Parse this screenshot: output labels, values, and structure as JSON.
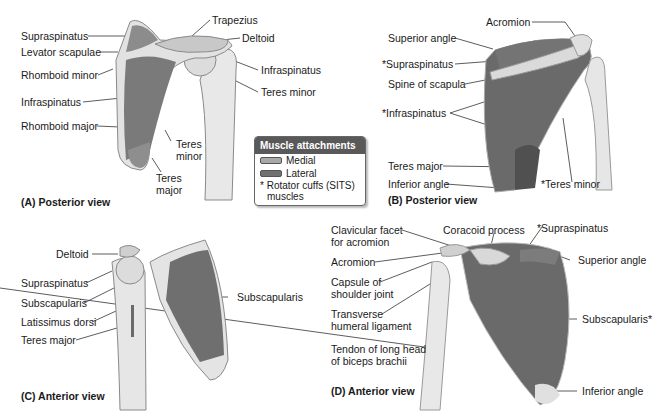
{
  "panels": {
    "A": {
      "caption": "(A) Posterior view",
      "labels": {
        "supraspinatus": "Supraspinatus",
        "levator_scapulae": "Levator scapulae",
        "rhomboid_minor": "Rhomboid minor",
        "infraspinatus": "Infraspinatus",
        "rhomboid_major": "Rhomboid major",
        "trapezius": "Trapezius",
        "deltoid": "Deltoid",
        "infraspinatus_humerus": "Infraspinatus",
        "teres_minor_humerus": "Teres minor",
        "teres_minor_1": "Teres",
        "teres_minor_2": "minor",
        "teres_major_1": "Teres",
        "teres_major_2": "major"
      }
    },
    "B": {
      "caption": "(B) Posterior view",
      "labels": {
        "acromion": "Acromion",
        "superior_angle": "Superior angle",
        "supraspinatus": "*Supraspinatus",
        "spine_of_scapula": "Spine of scapula",
        "infraspinatus": "*Infraspinatus",
        "teres_major": "Teres major",
        "inferior_angle": "Inferior angle",
        "teres_minor": "*Teres minor"
      }
    },
    "C": {
      "caption": "(C) Anterior view",
      "labels": {
        "deltoid": "Deltoid",
        "supraspinatus": "Supraspinatus",
        "subscapularis": "Subscapularis",
        "latissimus_dorsi": "Latissimus dorsi",
        "teres_major": "Teres major",
        "subscapularis_right": "Subscapularis"
      }
    },
    "D": {
      "caption": "(D) Anterior view",
      "labels": {
        "clavicular_facet_1": "Clavicular facet",
        "clavicular_facet_2": "for acromion",
        "coracoid_process": "Coracoid process",
        "supraspinatus": "*Supraspinatus",
        "acromion": "Acromion",
        "superior_angle": "Superior angle",
        "capsule_1": "Capsule of",
        "capsule_2": "shoulder joint",
        "transverse_1": "Transverse",
        "transverse_2": "humeral ligament",
        "subscapularis": "Subscapularis*",
        "tendon_1": "Tendon of long head",
        "tendon_2": "of biceps brachii",
        "inferior_angle": "Inferior angle"
      }
    }
  },
  "legend": {
    "title": "Muscle attachments",
    "items": [
      {
        "label": "Medial",
        "color": "#a8a8a8"
      },
      {
        "label": "Lateral",
        "color": "#707070"
      }
    ],
    "note_1": "* Rotator cuffs (SITS)",
    "note_2": "muscles"
  },
  "colors": {
    "bone": "#e6e6e6",
    "bone_edge": "#8a8a8a",
    "muscle_dark": "#5e5e5e",
    "muscle_mid": "#7a7a7a",
    "legend_header": "#595959"
  }
}
